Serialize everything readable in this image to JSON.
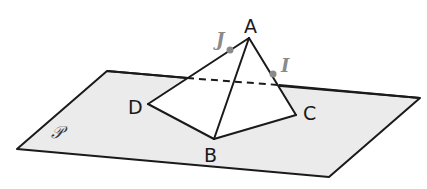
{
  "figure": {
    "type": "pyramid-on-plane",
    "colors": {
      "plane_fill": "#ebebeb",
      "stroke": "#1a1a1a",
      "face_fill": "#ffffff",
      "point_color": "#8a8a8a"
    },
    "plane": {
      "label": "𝒫",
      "corners": [
        [
          107,
          71
        ],
        [
          420,
          98
        ],
        [
          329,
          177
        ],
        [
          17,
          149
        ]
      ]
    },
    "vertices": {
      "A": {
        "label": "A",
        "pos": [
          249,
          38
        ]
      },
      "B": {
        "label": "B",
        "pos": [
          214,
          139
        ]
      },
      "C": {
        "label": "C",
        "pos": [
          296,
          115
        ]
      },
      "D": {
        "label": "D",
        "pos": [
          148,
          104
        ]
      }
    },
    "points": {
      "I": {
        "label": "I",
        "pos": [
          273,
          74
        ],
        "on_edge": "AC"
      },
      "J": {
        "label": "J",
        "pos": [
          230,
          50
        ],
        "on_edge": "AD"
      }
    },
    "hidden_segment": {
      "from": [
        187,
        78
      ],
      "to": [
        279,
        85
      ],
      "style": "dashed"
    }
  }
}
